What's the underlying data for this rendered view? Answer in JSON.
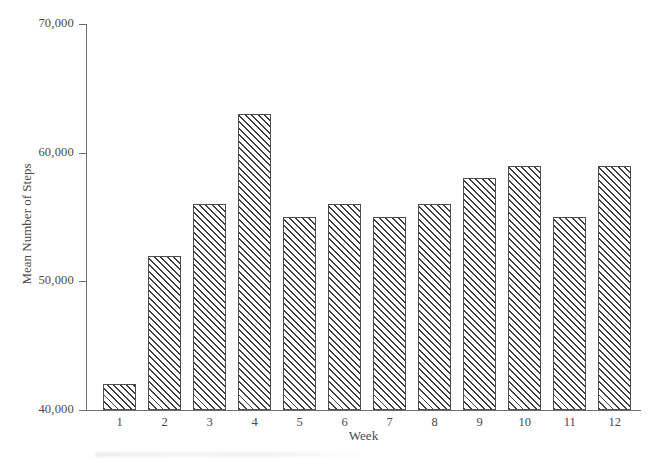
{
  "chart_data": {
    "type": "bar",
    "title": "",
    "xlabel": "Week",
    "ylabel": "Mean Number of Steps",
    "categories": [
      "1",
      "2",
      "3",
      "4",
      "5",
      "6",
      "7",
      "8",
      "9",
      "10",
      "11",
      "12"
    ],
    "values": [
      42000,
      52000,
      56000,
      63000,
      55000,
      56000,
      55000,
      56000,
      58000,
      59000,
      55000,
      59000
    ],
    "ylim": [
      40000,
      70000
    ],
    "ytick_values": [
      40000,
      50000,
      60000,
      70000
    ],
    "ytick_labels": [
      "40,000",
      "50,000",
      "60,000",
      "70,000"
    ],
    "grid": false,
    "legend": false,
    "bar_style": {
      "fill": "#ffffff",
      "hatch": "diagonal-45",
      "hatch_color": "#3f3f3f",
      "edge_color": "#4d4d4d"
    },
    "axis_color": "#6e6e6e",
    "text_color": "#4a4a4a",
    "background": "#ffffff"
  }
}
